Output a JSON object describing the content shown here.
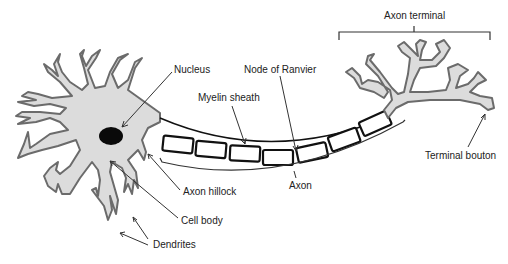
{
  "diagram": {
    "colors": {
      "cell_fill": "#dcdcdc",
      "cell_stroke": "#6b6b6b",
      "nucleus": "#0a0a0a",
      "myelin_stroke": "#111111",
      "line": "#333333",
      "text": "#222222"
    },
    "labels": {
      "nucleus": "Nucleus",
      "node_of_ranvier": "Node of Ranvier",
      "myelin_sheath": "Myelin sheath",
      "axon_terminal": "Axon terminal",
      "axon_hillock": "Axon hillock",
      "cell_body": "Cell body",
      "dendrites": "Dendrites",
      "axon": "Axon",
      "terminal_bouton": "Terminal bouton"
    },
    "myelin_segments": 7
  }
}
